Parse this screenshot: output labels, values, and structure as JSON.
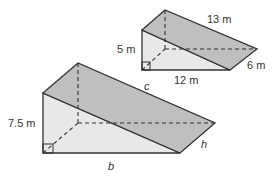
{
  "diagram": {
    "small_prism": {
      "height_label": "5 m",
      "base_label": "12 m",
      "hypotenuse_label": "13 m",
      "depth_label": "6 m"
    },
    "large_prism": {
      "height_label": "7.5 m",
      "base_label": "b",
      "hypotenuse_label": "c",
      "depth_label": "h"
    },
    "colors": {
      "front_face": "#e6e6e6",
      "slanted_face": "#bdbdbd",
      "edge": "#333333"
    }
  }
}
